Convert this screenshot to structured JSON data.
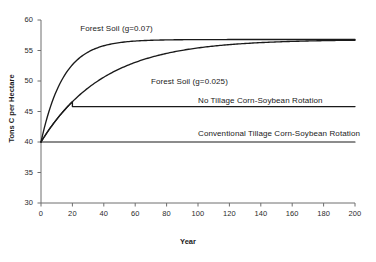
{
  "chart_data": {
    "type": "line",
    "title": "",
    "xlabel": "Year",
    "ylabel": "Tons C per Hectare",
    "xlim": [
      0,
      200
    ],
    "ylim": [
      30,
      60
    ],
    "xticks": [
      0,
      20,
      40,
      60,
      80,
      100,
      120,
      140,
      160,
      180,
      200
    ],
    "yticks": [
      30,
      35,
      40,
      45,
      50,
      55,
      60
    ],
    "grid": false,
    "legend_position": "inline-annotations",
    "line_color": "#1a1a1a",
    "series": [
      {
        "name": "Forest Soil (g=0.07)",
        "label": "Forest Soil (g=0.07)",
        "model": "40 + 16.8 * (1 - exp(-0.07 * year))",
        "start_value": 40,
        "asymptote": 56.8,
        "growth_rate": 0.07,
        "x": [
          0,
          10,
          20,
          30,
          40,
          50,
          60,
          80,
          100,
          120,
          140,
          160,
          180,
          200
        ],
        "values": [
          40.0,
          48.5,
          52.7,
          54.8,
          55.8,
          56.3,
          56.6,
          56.7,
          56.8,
          56.8,
          56.8,
          56.8,
          56.8,
          56.8
        ]
      },
      {
        "name": "Forest Soil (g=0.025)",
        "label": "Forest Soil (g=0.025)",
        "model": "40 + 16.8 * (1 - exp(-0.025 * year))",
        "start_value": 40,
        "asymptote": 56.8,
        "growth_rate": 0.025,
        "x": [
          0,
          10,
          20,
          30,
          40,
          50,
          60,
          80,
          100,
          120,
          140,
          160,
          180,
          200
        ],
        "values": [
          40.0,
          43.7,
          46.6,
          48.9,
          50.6,
          42.0,
          53.0,
          54.5,
          55.4,
          56.0,
          56.3,
          56.5,
          56.6,
          56.7
        ]
      },
      {
        "name": "No Tillage Corn-Soybean Rotation",
        "label": "No Tillage Corn-Soybean Rotation",
        "model": "rises with g=0.025 until year 20, then constant",
        "start_value": 40,
        "plateau_value": 45.8,
        "plateau_start_year": 20,
        "x": [
          0,
          5,
          10,
          15,
          20,
          40,
          60,
          80,
          100,
          120,
          140,
          160,
          180,
          200
        ],
        "values": [
          40.0,
          42.0,
          43.7,
          45.0,
          45.8,
          45.8,
          45.8,
          45.8,
          45.8,
          45.8,
          45.8,
          45.8,
          45.8,
          45.8
        ]
      },
      {
        "name": "Conventional Tillage Corn-Soybean Rotation",
        "label": "Conventional Tillage Corn-Soybean Rotation",
        "model": "constant at 40",
        "start_value": 40,
        "plateau_value": 40,
        "x": [
          0,
          50,
          100,
          150,
          200
        ],
        "values": [
          40,
          40,
          40,
          40,
          40
        ]
      }
    ],
    "annotations": [
      {
        "text": "Forest Soil (g=0.07)",
        "x_year": 25,
        "y_value": 58.6
      },
      {
        "text": "Forest Soil (g=0.025)",
        "x_year": 70,
        "y_value": 49.9
      },
      {
        "text": "No Tillage Corn-Soybean Rotation",
        "x_year": 100,
        "y_value": 46.7
      },
      {
        "text": "Conventional Tillage Corn-Soybean Rotation",
        "x_year": 100,
        "y_value": 41.3
      }
    ]
  },
  "axes": {
    "y_title": "Tons C per Hectare",
    "x_title": "Year",
    "y_tick_labels": [
      "60",
      "55",
      "50",
      "45",
      "40",
      "35",
      "30"
    ],
    "x_tick_labels": [
      "0",
      "20",
      "40",
      "60",
      "80",
      "100",
      "120",
      "140",
      "160",
      "180",
      "200"
    ]
  }
}
